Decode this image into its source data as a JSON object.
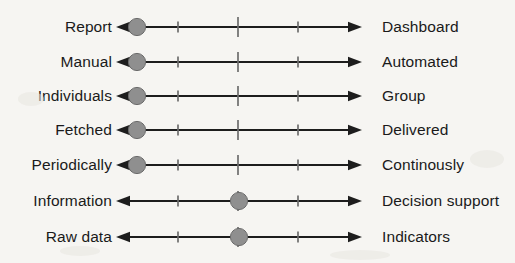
{
  "figure": {
    "title": "",
    "background_color": "#f6f5f2",
    "line_color": "#1d1d1d",
    "tick_color": "#6d6d6d",
    "marker_color": "#8f8f8f",
    "marker_edge_color": "#6b6b6b",
    "text_color": "#1a1a1a"
  },
  "chart_data": {
    "type": "scatter",
    "title": "",
    "xlabel": "",
    "ylabel": "",
    "xlim": [
      0,
      4
    ],
    "x_ticks": [
      1,
      2,
      3
    ],
    "grid": false,
    "legend": null,
    "axis_style": "double-headed-arrow",
    "note": "Seven bipolar rating scales; each row has a marker indicating position between the left and right anchors.",
    "categories": [
      "Report – Dashboard",
      "Manual – Automated",
      "Individuals – Group",
      "Fetched – Delivered",
      "Periodically – Continously",
      "Information – Decision support",
      "Raw data – Indicators"
    ],
    "values": [
      0.35,
      0.35,
      0.35,
      0.35,
      0.35,
      2.0,
      2.0
    ],
    "series": [
      {
        "name": "marker position",
        "values": [
          0.35,
          0.35,
          0.35,
          0.35,
          0.35,
          2.0,
          2.0
        ]
      }
    ]
  },
  "rows": [
    {
      "left_label": "Report",
      "right_label": "Dashboard",
      "marker_pos": 0.35,
      "marker_px": 21,
      "y": 27
    },
    {
      "left_label": "Manual",
      "right_label": "Automated",
      "marker_pos": 0.35,
      "marker_px": 21,
      "y": 62
    },
    {
      "left_label": "Individuals",
      "right_label": "Group",
      "marker_pos": 0.35,
      "marker_px": 21,
      "y": 96
    },
    {
      "left_label": "Fetched",
      "right_label": "Delivered",
      "marker_pos": 0.35,
      "marker_px": 21,
      "y": 130
    },
    {
      "left_label": "Periodically",
      "right_label": "Continously",
      "marker_pos": 0.35,
      "marker_px": 21,
      "y": 165
    },
    {
      "left_label": "Information",
      "right_label": "Decision support",
      "marker_pos": 2.0,
      "marker_px": 123,
      "y": 201
    },
    {
      "left_label": "Raw data",
      "right_label": "Indicators",
      "marker_pos": 2.0,
      "marker_px": 123,
      "y": 237
    }
  ]
}
